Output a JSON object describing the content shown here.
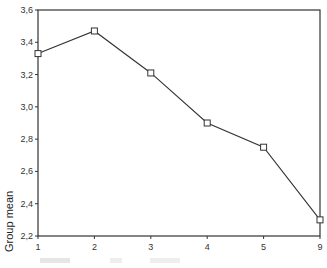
{
  "chart_data": {
    "type": "line",
    "title": "",
    "xlabel": "",
    "ylabel": "Group mean",
    "categories": [
      "1",
      "2",
      "3",
      "4",
      "5",
      "9"
    ],
    "series": [
      {
        "name": "Group mean",
        "values": [
          3.33,
          3.47,
          3.21,
          2.9,
          2.75,
          2.3
        ],
        "marker": "square"
      }
    ],
    "ylim": [
      2.2,
      3.6
    ],
    "yticks": [
      "2,2",
      "2,4",
      "2,6",
      "2,8",
      "3,0",
      "3,2",
      "3,4",
      "3,6"
    ],
    "grid": false,
    "legend": "none",
    "frame": "box"
  },
  "colors": {
    "line": "#333333",
    "frame": "#333333",
    "background": "#ffffff"
  }
}
